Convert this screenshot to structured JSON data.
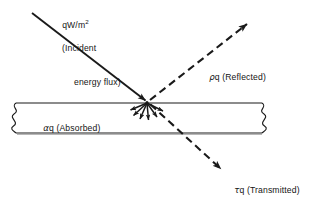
{
  "figure": {
    "name": "radiation-energy-balance",
    "background_color": "#ffffff",
    "ink_color": "#1a1a1a"
  },
  "labels": {
    "incident": {
      "symbol": "qW/m",
      "exponent": "2",
      "line2": "(Incident",
      "line3": "energy flux)"
    },
    "reflected": {
      "greek": "ρ",
      "text": "q (Reflected)"
    },
    "absorbed": {
      "greek": "α",
      "text": "q (Absorbed)"
    },
    "transmitted": {
      "greek": "τ",
      "text": "q (Transmitted)"
    }
  },
  "slab": {
    "top_y": 103,
    "bottom_y": 133,
    "left_break_x": 15,
    "right_break_x": 262
  },
  "rays": {
    "incident": {
      "style": "solid",
      "from": [
        32,
        13
      ],
      "to": [
        147,
        102
      ]
    },
    "reflected": {
      "style": "dashed",
      "from": [
        149,
        101
      ],
      "to": [
        250,
        22
      ]
    },
    "transmitted": {
      "style": "dashed",
      "from": [
        150,
        105
      ],
      "to": [
        224,
        172
      ]
    },
    "absorbed_burst_count": 6
  }
}
